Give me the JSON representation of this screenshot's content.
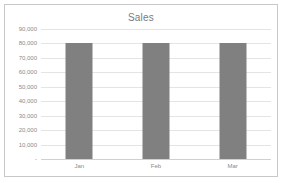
{
  "chart_data": {
    "type": "bar",
    "title": "Sales",
    "xlabel": "",
    "ylabel": "",
    "categories": [
      "Jan",
      "Feb",
      "Mar"
    ],
    "values": [
      80000,
      80000,
      80000
    ],
    "ylim": [
      0,
      90000
    ],
    "ytick_values": [
      90000,
      80000,
      70000,
      60000,
      50000,
      40000,
      30000,
      20000,
      10000,
      0
    ],
    "ytick_labels": [
      "90,000",
      "80,000",
      "70,000",
      "60,000",
      "50,000",
      "40,000",
      "30,000",
      "20,000",
      "10,000",
      "-"
    ],
    "grid": true,
    "legend": false,
    "legend_position": "none",
    "series": [
      {
        "name": "Sales",
        "values": [
          80000,
          80000,
          80000
        ],
        "color": "#808080"
      }
    ],
    "colors": {
      "bar": "#808080",
      "gridline": "#e4e4e4",
      "axis": "#d0d0d0",
      "title_text": "#7b7b7b",
      "tick_text": "#8a8a8a",
      "border": "#c8c8c8",
      "background": "#ffffff"
    }
  }
}
